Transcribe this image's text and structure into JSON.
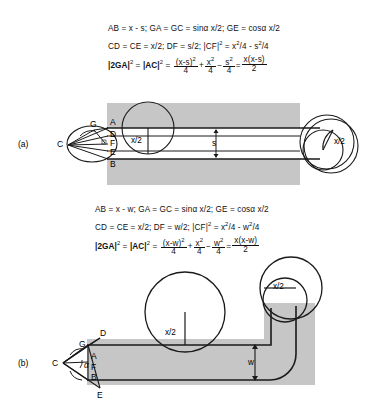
{
  "figure": {
    "panels": [
      {
        "id": "a",
        "label": "(a)",
        "formulas": {
          "line1": {
            "p1": "AB = x - s; GA = GC = sin",
            "alpha": "α",
            "p2": " x/2; GE = cos",
            "alpha2": "α",
            "p3": " x/2"
          },
          "line2": {
            "p1": "CD = CE = x/2; DF = s/2; |CF|",
            "sup1": "2",
            "p2": " = x",
            "sup2": "2",
            "p3": "/4 - s",
            "sup3": "2",
            "p4": "/4"
          },
          "line3": {
            "lhs1": "|2GA|",
            "lhs1sup": "2",
            "eq1": " = ",
            "lhs2": "|AC|",
            "lhs2sup": "2",
            "eq2": " = ",
            "f1num": "(x-s)",
            "f1numsup": "2",
            "f1den": "4",
            "plus": "+",
            "f2num": "x",
            "f2numsup": "2",
            "f2den": "4",
            "minus": "−",
            "f3num": "s",
            "f3numsup": "2",
            "f3den": "4",
            "eq3": "=",
            "f4num": "x(x-s)",
            "f4den": "2"
          }
        },
        "points": [
          "A",
          "D",
          "F",
          "E",
          "B",
          "G",
          "C"
        ],
        "dimensions": [
          {
            "name": "circle-radius-left",
            "label": "x/2"
          },
          {
            "name": "circle-radius-right",
            "label": "x/2"
          },
          {
            "name": "strip-width",
            "label": "s"
          }
        ]
      },
      {
        "id": "b",
        "label": "(b)",
        "formulas": {
          "line1": {
            "p1": "AB = x - w; GA = GC = sin",
            "alpha": "α",
            "p2": " x/2; GE = cos",
            "alpha2": "α",
            "p3": " x/2"
          },
          "line2": {
            "p1": "CD = CE = x/2; DF = w/2; |CF|",
            "sup1": "2",
            "p2": " = x",
            "sup2": "2",
            "p3": "/4 - w",
            "sup3": "2",
            "p4": "/4"
          },
          "line3": {
            "lhs1": "|2GA|",
            "lhs1sup": "2",
            "eq1": " = ",
            "lhs2": "|AC|",
            "lhs2sup": "2",
            "eq2": " = ",
            "f1num": "(x-w)",
            "f1numsup": "2",
            "f1den": "4",
            "plus": "+",
            "f2num": "x",
            "f2numsup": "2",
            "f2den": "4",
            "minus": "−",
            "f3num": "w",
            "f3numsup": "2",
            "f3den": "4",
            "eq3": "=",
            "f4num": "x(x-w)",
            "f4den": "2"
          }
        },
        "points": [
          "D",
          "G",
          "A",
          "F",
          "B",
          "E",
          "C"
        ],
        "angle_label": "α",
        "dimensions": [
          {
            "name": "circle-radius-mid",
            "label": "x/2"
          },
          {
            "name": "circle-radius-corner",
            "label": "x/2"
          },
          {
            "name": "path-width",
            "label": "w"
          }
        ]
      }
    ],
    "colors": {
      "material_gray": "#c6c6c6",
      "line_black": "#1a1a1a",
      "background": "#ffffff"
    }
  }
}
